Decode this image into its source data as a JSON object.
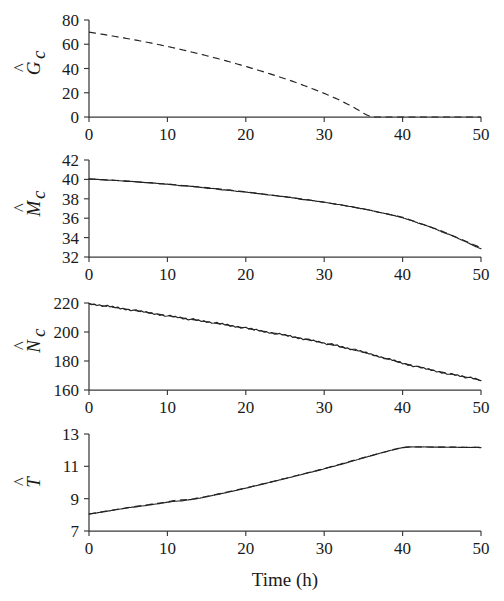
{
  "figure": {
    "xlabel": "Time (h)",
    "shared_x": {
      "min": 0,
      "max": 50,
      "ticks": [
        0,
        10,
        20,
        30,
        40,
        50
      ],
      "ticklabels": [
        "0",
        "10",
        "20",
        "30",
        "40",
        "50"
      ]
    }
  },
  "chart_data": [
    {
      "type": "line",
      "panel_index": 0,
      "title": "",
      "xlabel": "",
      "ylabel": "Ĝc",
      "ylabel_base": "G",
      "ylabel_sub": "c",
      "ylabel_hat": true,
      "xlim": [
        0,
        50
      ],
      "ylim": [
        0,
        80
      ],
      "yticks": [
        0,
        20,
        40,
        60,
        80
      ],
      "yticklabels": [
        "0",
        "20",
        "40",
        "60",
        "80"
      ],
      "grid": false,
      "legend": "none",
      "series": [
        {
          "name": "model",
          "style": "dashed",
          "x": [
            0,
            2,
            4,
            6,
            8,
            10,
            12,
            14,
            16,
            18,
            20,
            22,
            24,
            26,
            28,
            30,
            32,
            34,
            35.2,
            36,
            38,
            40,
            42,
            44,
            46,
            48,
            50
          ],
          "values": [
            70.0,
            67.9,
            65.7,
            63.4,
            60.9,
            58.2,
            55.3,
            52.2,
            48.9,
            45.4,
            41.7,
            37.8,
            33.7,
            29.4,
            24.6,
            19.5,
            13.9,
            7.1,
            2.4,
            0.0,
            0.0,
            0.0,
            0.0,
            0.0,
            0.0,
            0.0,
            0.0
          ]
        }
      ]
    },
    {
      "type": "line",
      "panel_index": 1,
      "title": "",
      "xlabel": "",
      "ylabel": "M̂c",
      "ylabel_base": "M",
      "ylabel_sub": "c",
      "ylabel_hat": true,
      "xlim": [
        0,
        50
      ],
      "ylim": [
        32,
        42
      ],
      "yticks": [
        32,
        34,
        36,
        38,
        40,
        42
      ],
      "yticklabels": [
        "32",
        "34",
        "36",
        "38",
        "40",
        "42"
      ],
      "grid": false,
      "legend": "none",
      "series": [
        {
          "name": "measured",
          "style": "solid-noisy",
          "x": [
            0,
            1,
            2,
            3,
            4,
            5,
            6,
            7,
            8,
            9,
            10,
            11,
            12,
            13,
            14,
            15,
            16,
            17,
            18,
            19,
            20,
            21,
            22,
            23,
            24,
            25,
            26,
            27,
            28,
            29,
            30,
            31,
            32,
            33,
            34,
            35,
            36,
            37,
            38,
            39,
            40,
            41,
            42,
            43,
            44,
            45,
            46,
            47,
            48,
            49,
            50
          ],
          "values": [
            40.05,
            40.0,
            39.95,
            39.92,
            39.86,
            39.8,
            39.76,
            39.68,
            39.65,
            39.55,
            39.5,
            39.42,
            39.33,
            39.3,
            39.2,
            39.1,
            39.05,
            38.92,
            38.88,
            38.75,
            38.7,
            38.58,
            38.5,
            38.4,
            38.3,
            38.2,
            38.1,
            37.95,
            37.88,
            37.75,
            37.65,
            37.5,
            37.4,
            37.25,
            37.1,
            36.95,
            36.8,
            36.6,
            36.45,
            36.25,
            36.05,
            35.8,
            35.5,
            35.25,
            34.95,
            34.6,
            34.3,
            33.95,
            33.6,
            33.2,
            32.85
          ]
        },
        {
          "name": "model",
          "style": "dashed",
          "x": [
            0,
            5,
            10,
            15,
            20,
            25,
            30,
            35,
            40,
            45,
            50
          ],
          "values": [
            40.05,
            39.82,
            39.52,
            39.15,
            38.72,
            38.22,
            37.66,
            36.96,
            36.1,
            34.68,
            32.95
          ]
        }
      ]
    },
    {
      "type": "line",
      "panel_index": 2,
      "title": "",
      "xlabel": "",
      "ylabel": "N̂c",
      "ylabel_base": "N",
      "ylabel_sub": "c",
      "ylabel_hat": true,
      "xlim": [
        0,
        50
      ],
      "ylim": [
        160,
        220
      ],
      "yticks": [
        160,
        180,
        200,
        220
      ],
      "yticklabels": [
        "160",
        "180",
        "200",
        "220"
      ],
      "grid": false,
      "legend": "none",
      "series": [
        {
          "name": "measured",
          "style": "solid-noisy",
          "x": [
            0,
            2,
            4,
            6,
            8,
            10,
            12,
            14,
            16,
            18,
            20,
            22,
            24,
            26,
            28,
            30,
            32,
            34,
            36,
            38,
            40,
            42,
            44,
            46,
            48,
            50
          ],
          "values": [
            219.5,
            218.0,
            216.4,
            214.7,
            213.0,
            211.3,
            209.6,
            207.9,
            206.2,
            204.4,
            202.6,
            200.7,
            198.8,
            196.8,
            194.7,
            192.4,
            190.0,
            187.4,
            184.6,
            181.6,
            178.5,
            175.8,
            173.4,
            171.2,
            169.0,
            166.5
          ]
        },
        {
          "name": "model",
          "style": "dashed",
          "x": [
            0,
            5,
            10,
            15,
            20,
            25,
            30,
            35,
            40,
            45,
            50
          ],
          "values": [
            219.5,
            215.5,
            211.3,
            207.1,
            202.6,
            197.9,
            192.4,
            186.0,
            178.5,
            172.3,
            166.8
          ]
        }
      ]
    },
    {
      "type": "line",
      "panel_index": 3,
      "title": "",
      "xlabel": "Time (h)",
      "ylabel": "T̂",
      "ylabel_base": "T",
      "ylabel_sub": "",
      "ylabel_hat": true,
      "xlim": [
        0,
        50
      ],
      "ylim": [
        7,
        13
      ],
      "yticks": [
        7,
        9,
        11,
        13
      ],
      "yticklabels": [
        "7",
        "9",
        "11",
        "13"
      ],
      "grid": false,
      "legend": "none",
      "series": [
        {
          "name": "measured",
          "style": "solid-noisy",
          "x": [
            0,
            1,
            2,
            3,
            4,
            5,
            6,
            7,
            8,
            9,
            10,
            11,
            12,
            13,
            14,
            15,
            16,
            17,
            18,
            19,
            20,
            21,
            22,
            23,
            24,
            25,
            26,
            27,
            28,
            29,
            30,
            31,
            32,
            33,
            34,
            35,
            36,
            37,
            38,
            39,
            40,
            41,
            42,
            43,
            44,
            45,
            46,
            47,
            48,
            49,
            50
          ],
          "values": [
            8.05,
            8.12,
            8.2,
            8.28,
            8.36,
            8.44,
            8.5,
            8.56,
            8.63,
            8.7,
            8.78,
            8.84,
            8.88,
            8.95,
            9.02,
            9.12,
            9.22,
            9.32,
            9.43,
            9.54,
            9.65,
            9.77,
            9.88,
            10.0,
            10.12,
            10.24,
            10.36,
            10.48,
            10.6,
            10.72,
            10.85,
            10.98,
            11.1,
            11.24,
            11.38,
            11.52,
            11.66,
            11.8,
            11.93,
            12.06,
            12.16,
            12.2,
            12.2,
            12.2,
            12.19,
            12.19,
            12.18,
            12.18,
            12.17,
            12.17,
            12.16
          ]
        },
        {
          "name": "model",
          "style": "dashed",
          "x": [
            0,
            5,
            10,
            11,
            13,
            15,
            20,
            25,
            30,
            35,
            40,
            41,
            45,
            50
          ],
          "values": [
            8.05,
            8.45,
            8.8,
            8.9,
            8.96,
            9.14,
            9.66,
            10.25,
            10.86,
            11.54,
            12.17,
            12.2,
            12.19,
            12.17
          ]
        }
      ]
    }
  ]
}
